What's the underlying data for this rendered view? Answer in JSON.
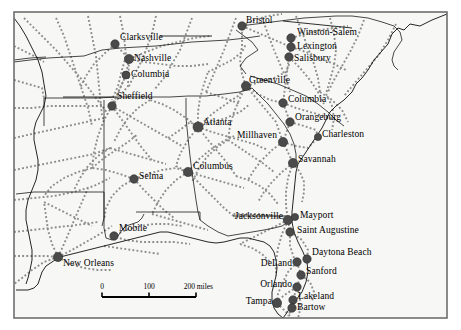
{
  "map": {
    "title": "Southeastern United States Route Network Map",
    "frame": {
      "x": 14,
      "y": 12,
      "width": 433,
      "height": 306
    },
    "background_color": "#f7f7f5",
    "outside_color": "#ffffff",
    "frame_color": "#6e6e6e",
    "network_line_color": "#8d8d8d",
    "boundary_color": "#1a1a1a",
    "marker_color": "#4a4a4a",
    "label_color": "#000000",
    "label_font_size": 9.5
  },
  "scale_bar": {
    "name": "scale-bar",
    "ticks": [
      "0",
      "100",
      "200 miles"
    ],
    "x_start": 102,
    "x_end": 196,
    "y": 297,
    "label_y": 283
  },
  "cities": [
    {
      "name": "Clarksville",
      "dot_x": 115,
      "dot_y": 44,
      "label_x": 120,
      "label_y": 33,
      "anchor": "start",
      "size": 4.2,
      "leader": [
        [
          160,
          36
        ],
        [
          210,
          36
        ]
      ]
    },
    {
      "name": "Nashville",
      "dot_x": 129,
      "dot_y": 59,
      "label_x": 134,
      "label_y": 54,
      "anchor": "start",
      "size": 4.6,
      "leader": null
    },
    {
      "name": "Columbia",
      "dot_x": 126,
      "dot_y": 75,
      "label_x": 131,
      "label_y": 70,
      "anchor": "start",
      "size": 4.0,
      "leader": null
    },
    {
      "name": "Sheffield",
      "dot_x": 112,
      "dot_y": 106,
      "label_x": 117,
      "label_y": 92,
      "anchor": "start",
      "size": 4.2,
      "leader": [
        [
          63,
          97
        ],
        [
          114,
          97
        ]
      ]
    },
    {
      "name": "Bristol",
      "dot_x": 242,
      "dot_y": 26,
      "label_x": 246,
      "label_y": 16,
      "anchor": "start",
      "size": 4.2,
      "leader": [
        [
          287,
          21
        ],
        [
          349,
          27
        ]
      ]
    },
    {
      "name": "Winston-Salem",
      "dot_x": 291,
      "dot_y": 38,
      "label_x": 297,
      "label_y": 28,
      "anchor": "start",
      "size": 4.2,
      "leader": null
    },
    {
      "name": "Lexington",
      "dot_x": 291,
      "dot_y": 47,
      "label_x": 297,
      "label_y": 42,
      "anchor": "start",
      "size": 4.2,
      "leader": null
    },
    {
      "name": "Salisbury",
      "dot_x": 289,
      "dot_y": 57,
      "label_x": 294,
      "label_y": 54,
      "anchor": "start",
      "size": 4.2,
      "leader": null
    },
    {
      "name": "Greenville",
      "dot_x": 246,
      "dot_y": 86,
      "label_x": 249,
      "label_y": 76,
      "anchor": "start",
      "size": 4.6,
      "leader": null
    },
    {
      "name": "Columbia",
      "dot_x": 283,
      "dot_y": 103,
      "label_x": 288,
      "label_y": 95,
      "anchor": "start",
      "size": 4.2,
      "leader": null
    },
    {
      "name": "Orangeburg",
      "dot_x": 290,
      "dot_y": 122,
      "label_x": 295,
      "label_y": 113,
      "anchor": "start",
      "size": 4.2,
      "leader": null
    },
    {
      "name": "Millhaven",
      "dot_x": 283,
      "dot_y": 142,
      "label_x": 277,
      "label_y": 131,
      "anchor": "end",
      "size": 4.6,
      "leader": null
    },
    {
      "name": "Charleston",
      "dot_x": 318,
      "dot_y": 137,
      "label_x": 322,
      "label_y": 130,
      "anchor": "start",
      "size": 3.6,
      "leader": null
    },
    {
      "name": "Savannah",
      "dot_x": 293,
      "dot_y": 163,
      "label_x": 298,
      "label_y": 155,
      "anchor": "start",
      "size": 4.6,
      "leader": null
    },
    {
      "name": "Atlanta",
      "dot_x": 198,
      "dot_y": 127,
      "label_x": 203,
      "label_y": 118,
      "anchor": "start",
      "size": 5.0,
      "leader": null
    },
    {
      "name": "Columbus",
      "dot_x": 188,
      "dot_y": 172,
      "label_x": 193,
      "label_y": 162,
      "anchor": "start",
      "size": 4.6,
      "leader": null
    },
    {
      "name": "Selma",
      "dot_x": 134,
      "dot_y": 179,
      "label_x": 139,
      "label_y": 172,
      "anchor": "start",
      "size": 4.2,
      "leader": null
    },
    {
      "name": "Mobile",
      "dot_x": 114,
      "dot_y": 236,
      "label_x": 119,
      "label_y": 224,
      "anchor": "start",
      "size": 4.2,
      "leader": null
    },
    {
      "name": "New Orleans",
      "dot_x": 58,
      "dot_y": 257,
      "label_x": 63,
      "label_y": 259,
      "anchor": "start",
      "size": 4.6,
      "leader": null
    },
    {
      "name": "Jacksonville",
      "dot_x": 288,
      "dot_y": 220,
      "label_x": 283,
      "label_y": 212,
      "anchor": "end",
      "size": 4.6,
      "leader": [
        [
          233,
          216
        ],
        [
          286,
          216
        ]
      ]
    },
    {
      "name": "Mayport",
      "dot_x": 295,
      "dot_y": 217,
      "label_x": 300,
      "label_y": 211,
      "anchor": "start",
      "size": 3.6,
      "leader": null
    },
    {
      "name": "Saint Augustine",
      "dot_x": 290,
      "dot_y": 232,
      "label_x": 297,
      "label_y": 226,
      "anchor": "start",
      "size": 4.2,
      "leader": null
    },
    {
      "name": "Daytona Beach",
      "dot_x": 307,
      "dot_y": 259,
      "label_x": 312,
      "label_y": 248,
      "anchor": "start",
      "size": 4.2,
      "leader": null
    },
    {
      "name": "DeLand",
      "dot_x": 297,
      "dot_y": 262,
      "label_x": 292,
      "label_y": 259,
      "anchor": "end",
      "size": 4.2,
      "leader": null
    },
    {
      "name": "Sanford",
      "dot_x": 301,
      "dot_y": 275,
      "label_x": 306,
      "label_y": 267,
      "anchor": "start",
      "size": 4.2,
      "leader": null
    },
    {
      "name": "Orlando",
      "dot_x": 297,
      "dot_y": 287,
      "label_x": 292,
      "label_y": 280,
      "anchor": "end",
      "size": 4.2,
      "leader": null
    },
    {
      "name": "Lakeland",
      "dot_x": 293,
      "dot_y": 300,
      "label_x": 298,
      "label_y": 292,
      "anchor": "start",
      "size": 4.2,
      "leader": null
    },
    {
      "name": "Bartow",
      "dot_x": 292,
      "dot_y": 308,
      "label_x": 297,
      "label_y": 303,
      "anchor": "start",
      "size": 4.2,
      "leader": null
    },
    {
      "name": "Tampa",
      "dot_x": 277,
      "dot_y": 303,
      "label_x": 272,
      "label_y": 297,
      "anchor": "end",
      "size": 4.6,
      "leader": null
    }
  ],
  "boundaries": [
    {
      "id": "coast-atlantic",
      "points": "447,14 432,20 420,26 410,24 404,30 398,28 392,34 388,44 381,52 374,60 368,70 362,78 356,84 352,92 344,100 336,106 330,112 326,120 322,128 318,134 314,140 310,146 306,152 302,158 298,164 296,172 295,182 294,192 293,202 292,212 292,222 294,232 298,242 303,252 307,262 308,272 306,282 302,292 296,300 290,308 286,314 283,318"
    },
    {
      "id": "coast-gulf",
      "points": "283,318 278,314 274,308 272,300 272,292 274,284 276,276 277,268 276,260 274,252 270,246 264,242 256,240 248,238 240,238 232,240 224,242 216,243 208,242 200,240 192,238 184,236 176,234 168,232 160,232 152,234 144,236 136,238 128,240 120,242 112,244 104,246 96,248 88,250 80,252 72,254 64,256 58,258 52,262 46,266 42,272 40,278 38,284 34,288 28,290 22,290 16,290"
    },
    {
      "id": "miss-river",
      "points": "14,18 20,26 26,36 32,48 38,60 42,72 44,84 46,96 44,106 40,114 36,122 34,130 34,140 36,150 38,160 38,170 36,180 32,190 28,200 26,210 26,220 28,230 30,240 32,250 32,260 30,270 28,278 26,284"
    },
    {
      "id": "state-ky-tn",
      "points": "14,62 30,60 48,58 66,57 84,56 102,50 120,48 138,47 156,46 174,44 192,42 210,41 228,40 246,38 260,36"
    },
    {
      "id": "state-tn-al",
      "points": "44,98 62,98 80,98 98,98 116,97 134,97 152,97 170,97 188,96 206,96 224,94 240,92 252,88"
    },
    {
      "id": "state-ms-al",
      "points": "104,100 104,118 104,138 104,158 104,178 104,198 104,214 104,228 106,238"
    },
    {
      "id": "state-al-ga",
      "points": "186,98 186,118 188,138 190,156 192,172 194,186 196,200 198,212 200,220"
    },
    {
      "id": "state-al-fl",
      "points": "136,212 158,212 180,212 200,212 200,220 208,226 218,232 228,236"
    },
    {
      "id": "state-ga-sc",
      "points": "252,88 260,96 268,104 276,114 284,124 290,134 294,144 296,154 296,162"
    },
    {
      "id": "state-ga-fl",
      "points": "228,236 240,234 252,232 264,230 274,228 282,226 288,222"
    },
    {
      "id": "state-nc-sc",
      "points": "250,76 264,80 278,84 292,90 306,96 318,104 328,112 336,120 344,126"
    },
    {
      "id": "state-nc-va",
      "points": "240,26 256,24 272,22 288,20 304,18 320,17 336,16 352,16 368,18 382,22 394,26"
    },
    {
      "id": "state-tn-nc",
      "points": "236,30 244,36 252,42 258,50 246,58 240,66 246,74"
    },
    {
      "id": "state-ar-mo",
      "points": "14,60 30,58 46,57"
    },
    {
      "id": "state-ar-la",
      "points": "16,194 34,192 52,192 70,192 88,192 104,192"
    },
    {
      "id": "state-ms-la",
      "points": "104,192 104,206 104,218 102,226"
    },
    {
      "id": "state-tn-ms",
      "points": "44,98 44,112 44,126"
    },
    {
      "id": "state-nc-east",
      "points": "394,26 400,32 402,40 398,46 394,52 392,60 394,66 398,70"
    },
    {
      "id": "boundary-fl-pan",
      "points": "106,238 112,240 118,236 122,230 126,226 132,224 138,222 142,218 144,214"
    }
  ],
  "network_lines": [
    "24,18 40,34 56,50 70,66 84,82 96,98 108,114",
    "56,18 64,36 70,54 76,72 82,90 88,108 92,126",
    "88,16 92,36 96,56 98,76 100,96 102,116",
    "120,16 124,36 126,56 122,70 118,86 112,100",
    "156,16 152,34 146,50 140,64 134,76 128,88",
    "192,18 186,34 180,50 172,64 164,78 154,90",
    "236,18 230,34 224,50 218,64 212,78 206,92",
    "262,18 268,34 274,50 280,64 286,78 290,92",
    "296,16 302,32 308,48 314,64 318,78 320,92",
    "330,18 334,34 336,50 334,66 330,80 326,94",
    "364,20 358,36 350,52 342,66 334,80 328,92",
    "396,24 388,40 378,56 366,70 354,84 344,96",
    "14,108 32,108 50,106 68,106 86,106 104,106",
    "14,138 32,134 50,130 68,126 86,122 104,118",
    "14,170 34,166 54,162 74,158 94,154 110,148",
    "14,200 34,198 54,196 74,192 94,186 110,178",
    "14,232 32,230 50,228 68,226 84,224 98,222",
    "14,256 30,256 46,256 58,257",
    "58,257 72,250 86,242 100,234 112,226",
    "58,257 70,264 84,268 98,270 112,270",
    "58,257 44,262 32,270 22,278 14,284",
    "58,257 52,244 48,230 46,216 44,202",
    "58,257 64,244 70,230 76,216 82,202 88,188",
    "112,106 120,96 128,86 129,59",
    "112,106 126,75",
    "115,44 129,59 126,75 112,106",
    "112,106 122,120 132,134 142,148 152,160",
    "112,106 104,120 98,136 94,152 92,168",
    "112,106 126,114 140,122 154,130 168,138 182,146",
    "115,44 104,54 94,64 86,76 80,88",
    "129,59 144,62 160,64 176,66 192,66 208,64",
    "129,59 146,52 162,46 178,42 194,38 210,36",
    "134,179 148,174 162,170 176,168 188,172",
    "134,179 144,190 154,200 164,210 174,218",
    "134,179 122,186 112,196 106,208 104,220",
    "134,179 120,174 106,170 92,168",
    "112,236 126,230 140,226 154,224 168,224 182,226",
    "112,236 126,240 142,242 158,242 174,242 190,244",
    "198,127 212,122 226,118 240,112 250,104",
    "198,127 212,132 226,136 240,140 254,144 268,150",
    "198,127 208,140 218,152 228,164 236,176",
    "198,127 188,140 180,154 176,166 188,172",
    "198,127 186,118 174,110 162,104 150,100",
    "198,127 198,112 200,98 204,84 208,72",
    "198,127 212,114 226,104 238,96 246,86",
    "188,172 202,176 216,180 230,184 244,188",
    "188,172 200,184 212,196 224,208 236,218",
    "188,172 176,180 166,190 158,202 152,214",
    "188,172 198,160 210,150 222,142 234,136",
    "246,86 260,82 274,78 286,72 290,62",
    "246,86 258,94 270,100 283,103",
    "246,86 256,98 266,110 276,122 283,142",
    "246,86 240,98 234,112 230,126 228,140",
    "246,86 242,74 240,60 242,46 242,26",
    "242,26 254,20 268,16 282,14",
    "242,26 256,32 270,38 284,44 291,47",
    "291,38 291,47 289,57 283,103",
    "291,38 306,34 320,30 334,28 348,26",
    "291,47 306,52 320,58 334,64 346,70",
    "289,57 300,68 310,80 318,92 324,104",
    "283,103 290,122 283,142 293,163",
    "283,103 296,108 310,112 324,116 336,120",
    "290,122 304,126 316,130 318,137",
    "283,142 296,146 308,148 318,137",
    "283,142 272,150 262,160 254,170 248,180",
    "293,163 282,172 272,182 264,192 258,202",
    "293,163 288,178 286,192 286,206 288,220",
    "293,163 300,172 304,182 304,192 302,202",
    "288,220 274,216 260,214 246,214 232,214",
    "288,220 276,226 264,232 252,238 240,244",
    "288,220 290,232 290,246 294,258 297,262",
    "288,220 282,234 278,248 276,262 276,276",
    "290,232 302,240 308,250 307,259",
    "297,262 301,275 297,287 293,300",
    "297,262 288,272 282,284 278,294 277,303",
    "301,275 310,282 314,292 312,302",
    "297,287 286,294 278,300 277,303",
    "293,300 292,308 288,316",
    "277,303 284,310 290,316",
    "297,287 300,298 300,310 298,318",
    "236,176 248,180 260,186 270,194 278,204",
    "152,214 166,218 180,222 194,226 208,230",
    "92,168 78,172 64,178 52,186 44,196",
    "92,168 104,158 116,150 128,142 138,134",
    "168,138 180,130 190,122 198,127",
    "208,72 220,66 232,60 242,52 246,44",
    "150,100 138,108 128,118 120,130 114,142",
    "228,140 240,148 252,156 264,164 274,172",
    "228,140 216,148 206,158 198,170 192,182",
    "104,246 118,248 132,250 146,252 160,254",
    "44,202 56,208 68,214 80,220 92,226",
    "110,148 124,152 138,156 152,160 166,164",
    "110,148 98,156 88,166 80,178 74,190",
    "14,80 28,84 42,88 44,98",
    "14,46 26,52 38,58 44,62",
    "206,92 218,96 230,100 240,104",
    "320,92 332,100 342,110 348,122",
    "326,94 332,106 334,118 332,130",
    "240,244 252,248 262,254 270,262"
  ],
  "leaders": [
    {
      "from": [
        160,
        36
      ],
      "to": [
        212,
        36
      ]
    },
    {
      "from": [
        63,
        97
      ],
      "to": [
        114,
        97
      ]
    },
    {
      "from": [
        283,
        21
      ],
      "to": [
        352,
        28
      ]
    },
    {
      "from": [
        233,
        216
      ],
      "to": [
        286,
        216
      ]
    }
  ]
}
